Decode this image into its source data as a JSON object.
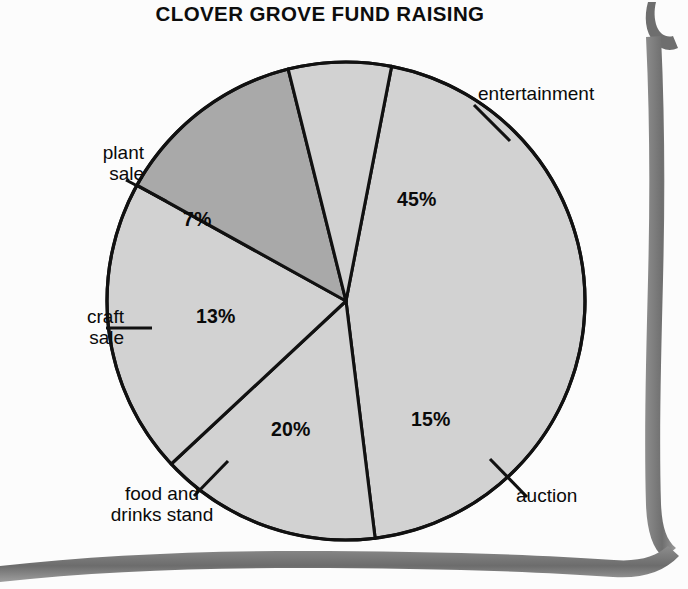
{
  "document": {
    "type": "scanned-page",
    "background_color": "#fdfdfd"
  },
  "chart_title": "CLOVER GROVE FUND RAISING",
  "chart_data": {
    "type": "pie",
    "title": "CLOVER GROVE FUND RAISING",
    "xlabel": "",
    "ylabel": "",
    "unit": "%",
    "total": 100,
    "legend_position": "outside-labels",
    "grid": false,
    "categories": [
      "entertainment",
      "auction",
      "food and drinks stand",
      "craft sale",
      "plant sale"
    ],
    "values": [
      45,
      15,
      20,
      13,
      7
    ],
    "labels": [
      "45%",
      "15%",
      "20%",
      "13%",
      "7%"
    ],
    "slices": [
      {
        "name": "entertainment",
        "label": "entertainment",
        "value": 45,
        "value_label": "45%",
        "color": "#d2d2d2",
        "start_angle_deg": -79,
        "end_angle_deg": 83
      },
      {
        "name": "auction",
        "label": "auction",
        "value": 15,
        "value_label": "15%",
        "color": "#d2d2d2",
        "start_angle_deg": 83,
        "end_angle_deg": 137
      },
      {
        "name": "food-and-drinks-stand",
        "label": "food and\ndrinks stand",
        "value": 20,
        "value_label": "20%",
        "color": "#d2d2d2",
        "start_angle_deg": 137,
        "end_angle_deg": 209
      },
      {
        "name": "craft-sale",
        "label": "craft\nsale",
        "value": 13,
        "value_label": "13%",
        "color": "#a9a9a9",
        "start_angle_deg": 209,
        "end_angle_deg": 256
      },
      {
        "name": "plant-sale",
        "label": "plant\nsale",
        "value": 7,
        "value_label": "7%",
        "color": "#d2d2d2",
        "start_angle_deg": 256,
        "end_angle_deg": 281
      }
    ],
    "colors": {
      "slice_light": "#d2d2d2",
      "slice_dark": "#a9a9a9",
      "outline": "#111111",
      "text": "#0a0a0a"
    },
    "geometry": {
      "center_x": 346,
      "center_y": 301,
      "radius": 239
    }
  },
  "labels": {
    "entertainment": "entertainment",
    "plant_sale_line1": "plant",
    "plant_sale_line2": "sale",
    "craft_sale_line1": "craft",
    "craft_sale_line2": "sale",
    "food_stand_line1": "food and",
    "food_stand_line2": "drinks stand",
    "auction": "auction"
  },
  "percentages": {
    "entertainment": "45%",
    "auction": "15%",
    "food_stand": "20%",
    "craft_sale": "13%",
    "plant_sale": "7%"
  }
}
